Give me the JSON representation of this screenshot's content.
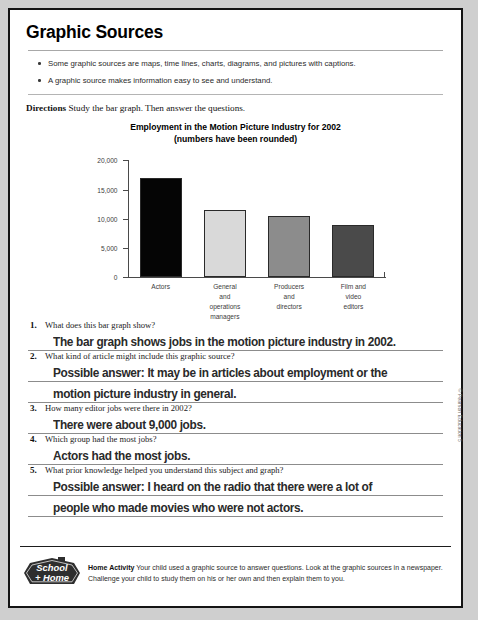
{
  "page": {
    "title": "Graphic Sources",
    "bullets": [
      "Some graphic sources are maps, time lines, charts, diagrams, and pictures with captions.",
      "A graphic source makes information easy to see and understand."
    ],
    "directions_label": "Directions",
    "directions_text": "Study the bar graph. Then answer the questions.",
    "copyright": "© Pearson Education 5"
  },
  "chart_data": {
    "type": "bar",
    "title": "Employment in the Motion Picture Industry for 2002",
    "subtitle": "(numbers have been rounded)",
    "xlabel": "",
    "ylabel": "",
    "ylim": [
      0,
      20000
    ],
    "yticks": [
      0,
      5000,
      10000,
      15000,
      20000
    ],
    "ytick_labels": [
      "0",
      "5,000",
      "10,000",
      "15,000",
      "20,000"
    ],
    "grid": false,
    "legend": "none",
    "categories": [
      "Actors",
      "General and operations managers",
      "Producers and directors",
      "Film and video editors"
    ],
    "category_lines": [
      [
        "Actors"
      ],
      [
        "General",
        "and",
        "operations",
        "managers"
      ],
      [
        "Producers",
        "and",
        "directors"
      ],
      [
        "Film and",
        "video",
        "editors"
      ]
    ],
    "values": [
      17000,
      11500,
      10500,
      9000
    ],
    "bar_colors": [
      "#050505",
      "#d9d9d9",
      "#8c8c8c",
      "#4a4a4a"
    ],
    "bar_outline": "#2a2a2a"
  },
  "questions": [
    {
      "number": "1.",
      "prompt": "What does this bar graph show?",
      "answer_lines": [
        "The bar graph shows jobs in the motion picture industry in 2002."
      ]
    },
    {
      "number": "2.",
      "prompt": "What kind of article might include this graphic source?",
      "answer_lines": [
        "Possible answer: It may be in articles about employment or the",
        "motion picture industry in general."
      ]
    },
    {
      "number": "3.",
      "prompt": "How many editor jobs were there in 2002?",
      "answer_lines": [
        "There were about 9,000 jobs."
      ]
    },
    {
      "number": "4.",
      "prompt": "Which group had the most jobs?",
      "answer_lines": [
        "Actors had the most jobs."
      ]
    },
    {
      "number": "5.",
      "prompt": "What prior knowledge helped you understand this subject and graph?",
      "answer_lines": [
        "Possible answer: I heard on the radio that there were a lot of",
        "people who made movies who were not actors."
      ]
    }
  ],
  "footer": {
    "logo_line1": "School",
    "logo_line2": "+ Home",
    "heading": "Home Activity",
    "text": "Your child used a graphic source to answer questions. Look at the graphic sources in a newspaper. Challenge your child to study them on his or her own and then explain them to you."
  }
}
